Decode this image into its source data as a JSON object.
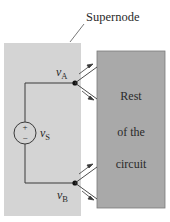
{
  "diagram": {
    "supernode_label": "Supernode",
    "node_a": {
      "symbol": "v",
      "subscript": "A"
    },
    "node_b": {
      "symbol": "v",
      "subscript": "B"
    },
    "source": {
      "symbol": "v",
      "subscript": "S",
      "plus": "+",
      "minus": "−"
    },
    "rest_of_circuit": [
      "Rest",
      "of the",
      "circuit"
    ],
    "colors": {
      "supernode_fill": "#d4d4d4",
      "rest_fill": "#a9a9a9",
      "rest_stroke": "#7a7a7a",
      "wire": "#3a3a3a",
      "node": "#111111"
    }
  }
}
